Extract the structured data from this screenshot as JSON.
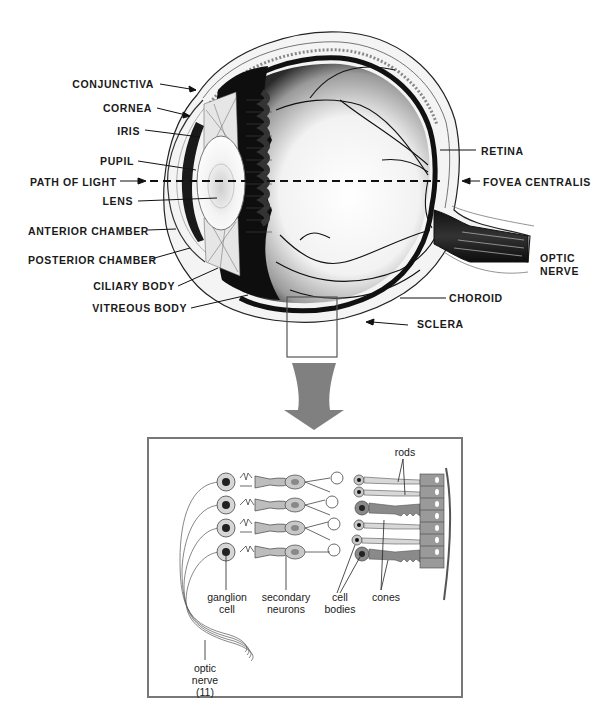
{
  "figure": {
    "colors": {
      "ink": "#111111",
      "background": "#ffffff",
      "arrow": "#808080",
      "cell_fill_light": "#c8c8c8",
      "cell_fill_dark": "#8a8a8a",
      "inset_border": "#777777"
    }
  },
  "eye_labels": {
    "left": [
      {
        "id": "conjunctiva",
        "text": "CONJUNCTIVA"
      },
      {
        "id": "cornea",
        "text": "CORNEA"
      },
      {
        "id": "iris",
        "text": "IRIS"
      },
      {
        "id": "pupil",
        "text": "PUPIL"
      },
      {
        "id": "path_of_light",
        "text": "PATH OF LIGHT"
      },
      {
        "id": "lens",
        "text": "LENS"
      },
      {
        "id": "anterior_chamber",
        "text": "ANTERIOR CHAMBER"
      },
      {
        "id": "posterior_chamber",
        "text": "POSTERIOR CHAMBER"
      },
      {
        "id": "ciliary_body",
        "text": "CILIARY BODY"
      },
      {
        "id": "vitreous_body",
        "text": "VITREOUS BODY"
      }
    ],
    "right": [
      {
        "id": "retina",
        "text": "RETINA"
      },
      {
        "id": "fovea_centralis",
        "text": "FOVEA CENTRALIS"
      },
      {
        "id": "optic_nerve_line1",
        "text": "OPTIC"
      },
      {
        "id": "optic_nerve_line2",
        "text": "NERVE"
      },
      {
        "id": "choroid",
        "text": "CHOROID"
      },
      {
        "id": "sclera",
        "text": "SCLERA"
      }
    ]
  },
  "retina_inset": {
    "labels": {
      "rods": "rods",
      "ganglion_line1": "ganglion",
      "ganglion_line2": "cell",
      "secondary_line1": "secondary",
      "secondary_line2": "neurons",
      "cell_bodies_line1": "cell",
      "cell_bodies_line2": "bodies",
      "cones": "cones",
      "optic_nerve_line1": "optic",
      "optic_nerve_line2": "nerve",
      "optic_nerve_line3": "(11)"
    }
  }
}
